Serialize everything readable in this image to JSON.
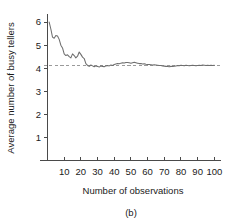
{
  "chart_data": {
    "type": "line",
    "title": "",
    "xlabel": "Number of observations",
    "ylabel": "Average number of busy tellers",
    "caption": "(b)",
    "xlim": [
      0,
      104
    ],
    "ylim": [
      0,
      6.35
    ],
    "grid": false,
    "legend": "none",
    "line_color": "#6e6e6e",
    "reference_line_color": "#9a9a9a",
    "axis_color": "#4a4a4a",
    "background_color": "#ffffff",
    "xticks": [
      10,
      20,
      30,
      40,
      50,
      60,
      70,
      80,
      90,
      100
    ],
    "xtick_labels": [
      "10",
      "20",
      "30",
      "40",
      "50",
      "60",
      "70",
      "80",
      "90",
      "100"
    ],
    "yticks": [
      1,
      2,
      3,
      4,
      5,
      6
    ],
    "ytick_labels": [
      "1",
      "2",
      "3",
      "4",
      "5",
      "6"
    ],
    "reference_line": {
      "value": 4.1,
      "orientation": "horizontal",
      "style": "dashed",
      "label": ""
    },
    "series": [
      {
        "name": "Cumulative average number of busy tellers",
        "x": [
          1,
          2,
          3,
          4,
          5,
          6,
          7,
          8,
          9,
          10,
          11,
          12,
          13,
          14,
          15,
          16,
          17,
          18,
          19,
          20,
          21,
          22,
          23,
          24,
          25,
          26,
          27,
          28,
          29,
          30,
          31,
          32,
          33,
          34,
          35,
          36,
          37,
          38,
          39,
          40,
          41,
          42,
          43,
          44,
          45,
          46,
          47,
          48,
          49,
          50,
          51,
          52,
          53,
          54,
          55,
          56,
          57,
          58,
          59,
          60,
          61,
          62,
          63,
          64,
          65,
          66,
          67,
          68,
          69,
          70,
          71,
          72,
          73,
          74,
          75,
          76,
          77,
          78,
          79,
          80,
          81,
          82,
          83,
          84,
          85,
          86,
          87,
          88,
          89,
          90,
          91,
          92,
          93,
          94,
          95,
          96,
          97,
          98,
          99,
          100
        ],
        "y": [
          6.0,
          5.7,
          5.35,
          5.3,
          5.42,
          5.4,
          5.25,
          5.0,
          4.88,
          4.62,
          4.55,
          4.58,
          4.5,
          4.45,
          4.62,
          4.55,
          4.45,
          4.52,
          4.7,
          4.6,
          4.48,
          4.42,
          4.2,
          4.12,
          4.08,
          4.14,
          4.1,
          4.06,
          4.1,
          4.08,
          4.05,
          4.1,
          4.08,
          4.06,
          4.1,
          4.12,
          4.1,
          4.14,
          4.12,
          4.16,
          4.18,
          4.2,
          4.19,
          4.22,
          4.24,
          4.23,
          4.25,
          4.25,
          4.24,
          4.22,
          4.24,
          4.26,
          4.24,
          4.22,
          4.2,
          4.2,
          4.18,
          4.19,
          4.17,
          4.16,
          4.16,
          4.15,
          4.14,
          4.15,
          4.14,
          4.13,
          4.12,
          4.12,
          4.1,
          4.09,
          4.08,
          4.07,
          4.06,
          4.08,
          4.07,
          4.09,
          4.1,
          4.12,
          4.11,
          4.13,
          4.12,
          4.11,
          4.13,
          4.12,
          4.11,
          4.12,
          4.13,
          4.12,
          4.11,
          4.12,
          4.13,
          4.12,
          4.14,
          4.13,
          4.12,
          4.13,
          4.12,
          4.13,
          4.12,
          4.13
        ]
      }
    ]
  }
}
